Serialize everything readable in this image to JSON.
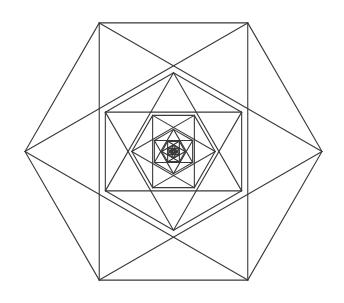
{
  "figure": {
    "type": "geometric-line-diagram",
    "background_color": "#ffffff",
    "stroke_color": "#3a3a3a",
    "stroke_width": 1.1,
    "canvas": {
      "width": 344,
      "height": 303
    },
    "center": {
      "x": 173.5,
      "y": 151.5
    },
    "outer_radius": 148.5,
    "level_scale": 0.53,
    "level_rotation_degrees": 30,
    "levels": 8,
    "start_rotation_degrees": 0,
    "per_level_elements": [
      "hexagon-outline",
      "upward-triangle",
      "downward-triangle"
    ],
    "vertex_count_per_hexagon": 6,
    "measured_outer_vertices": [
      {
        "label": "right",
        "x": 322,
        "y": 151.5
      },
      {
        "label": "top-right",
        "x": 248,
        "y": 13
      },
      {
        "label": "top-left",
        "x": 99,
        "y": 13
      },
      {
        "label": "left",
        "x": 25,
        "y": 151.5
      },
      {
        "label": "bottom-left",
        "x": 99,
        "y": 290
      },
      {
        "label": "bottom-right",
        "x": 248,
        "y": 290
      }
    ],
    "measured_level2_vertices": [
      {
        "label": "top-left",
        "x": 62,
        "y": 81
      },
      {
        "label": "top-right",
        "x": 285,
        "y": 81
      }
    ],
    "measured_level3_vertices": [
      {
        "label": "left",
        "x": 120,
        "y": 113
      },
      {
        "label": "mid",
        "x": 173,
        "y": 113
      },
      {
        "label": "right",
        "x": 228,
        "y": 113
      }
    ]
  }
}
